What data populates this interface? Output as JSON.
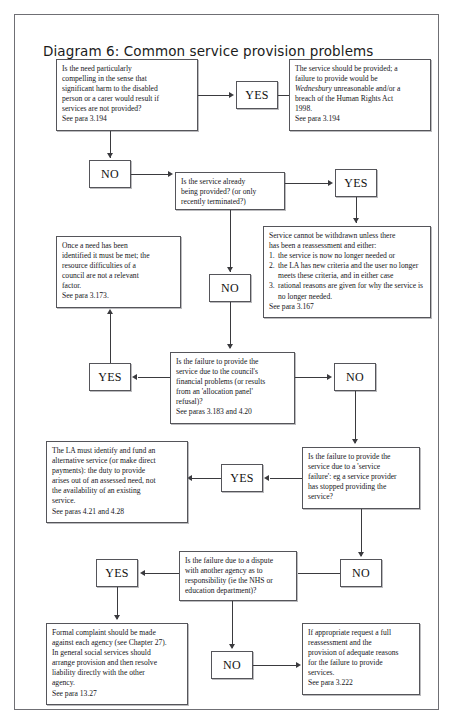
{
  "page": {
    "header_mark": "",
    "title": "Diagram 6: Common service provision problems"
  },
  "labels": {
    "yes": "YES",
    "no": "NO"
  },
  "nodes": {
    "q_compelling": {
      "lines": [
        "Is the need particularly",
        "compelling in the sense that",
        "significant harm to the disabled",
        "person or a carer would result if",
        "services are not provided?",
        "See para 3.194"
      ]
    },
    "out_should_provide": {
      "line1": "The service should be provided; a",
      "line2": "failure to provide would be",
      "italic": "Wednesbury",
      "line3": " unreasonable and/or a",
      "line4": "breach of the Human Rights Act",
      "line5": "1998.",
      "line6": "See para 3.194"
    },
    "q_already_provided": {
      "lines": [
        "Is the service already",
        "being provided? (or only",
        "recently terminated?)"
      ]
    },
    "out_cannot_withdraw": {
      "intro1": "Service cannot be withdrawn unless there",
      "intro2": "has been a reassessment and either:",
      "items": [
        {
          "num": "1.",
          "text": "the service is now no longer needed or"
        },
        {
          "num": "2.",
          "text": "the LA has new criteria and the user no longer meets these criteria, and in either case"
        },
        {
          "num": "3.",
          "text": "rational reasons are given for why the service is no longer needed."
        }
      ],
      "ref": "See para 3.167"
    },
    "out_need_met": {
      "lines": [
        "Once a need has been",
        "identified it must be met; the",
        "resource difficulties of a",
        "council are not a relevant",
        "factor.",
        "See para 3.173."
      ]
    },
    "q_financial": {
      "lines": [
        "Is the failure to provide the",
        "service due to the council's",
        "financial problems (or results",
        "from an 'allocation panel'",
        "refusal)?",
        "See paras 3.183 and 4.20"
      ]
    },
    "out_alternative_service": {
      "lines": [
        "The LA must identify and fund an",
        "alternative service (or make direct",
        "payments): the duty to provide",
        "arises out of an assessed need, not",
        "the availability of an existing",
        "service.",
        "See paras 4.21 and 4.28"
      ]
    },
    "q_service_failure": {
      "lines": [
        "Is the failure to provide the",
        "service due to a 'service",
        "failure': eg a service provider",
        "has stopped providing the",
        "service?"
      ]
    },
    "q_dispute": {
      "lines": [
        "Is the failure due to a dispute",
        "with another agency as to",
        "responsibility (ie the NHS or",
        "education department)?"
      ]
    },
    "out_formal_complaint": {
      "lines": [
        "Formal complaint should be made",
        "against each agency (see Chapter 27).",
        "In general social services should",
        "arrange provision and then resolve",
        "liability directly with the other",
        "agency.",
        "See para 13.27"
      ]
    },
    "out_reassessment": {
      "lines": [
        "If appropriate request a full",
        "reassessment and the",
        "provision of adequate reasons",
        "for the failure to provide",
        "services.",
        "See para 3.222"
      ]
    }
  }
}
